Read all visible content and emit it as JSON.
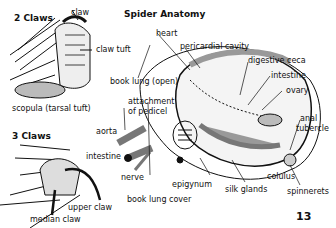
{
  "title": "Spider Anatomy",
  "page_number": "13",
  "panels": {
    "two_claws": {
      "heading": "2 Claws",
      "labels": [
        "claw",
        "claw tuft",
        "scopula (tarsal tuft)"
      ]
    },
    "three_claws": {
      "heading": "3 Claws",
      "labels": [
        "upper claw",
        "median claw"
      ]
    }
  },
  "anatomy_labels": {
    "heart": "heart",
    "pericardial_cavity": "pericardial cavity",
    "digestive_ceca": "digestive ceca",
    "intestine_abd": "intestine",
    "ovary": "ovary",
    "anal": "anal",
    "tubercle": "tubercle",
    "book_lung_open": "book lung (open)",
    "attachment": "attachment",
    "of_pedicel": "of pedicel",
    "aorta": "aorta",
    "intestine": "intestine",
    "nerve": "nerve",
    "epigynum": "epigynum",
    "book_lung_cover": "book lung cover",
    "silk_glands": "silk glands",
    "colulus": "colulus",
    "spinnerets": "spinnerets"
  }
}
